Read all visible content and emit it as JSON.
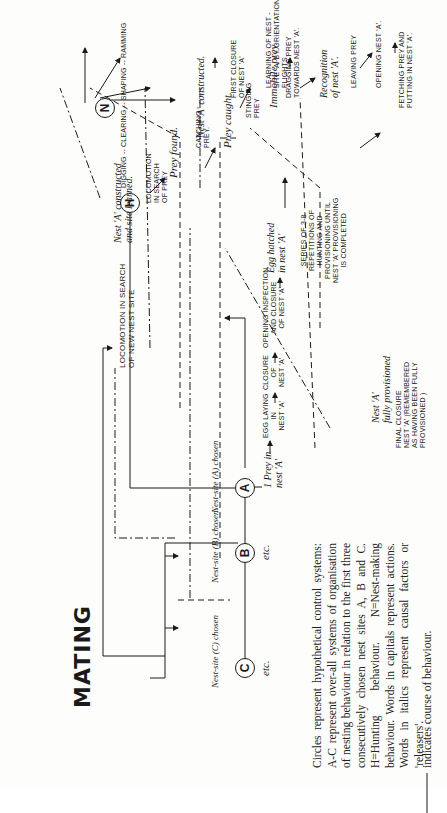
{
  "figure": {
    "title": "MATING",
    "control_systems": [
      {
        "id": "A",
        "label": "Nest-site (A) chosen"
      },
      {
        "id": "B",
        "label": "Nest-site (B) chosen."
      },
      {
        "id": "C",
        "label": "Nest-site (C) chosen"
      },
      {
        "id": "H",
        "label": ""
      },
      {
        "id": "N",
        "label": ""
      }
    ],
    "etc_label": "etc.",
    "nodes": {
      "locomotion_nest_site_1": "Locomotion in search",
      "locomotion_nest_site_2": "of new nest site",
      "prey_in_nest_1": "1 Prey in",
      "prey_in_nest_2": "nest 'A'",
      "egg_laying_1": "Egg laying",
      "egg_laying_2": "in",
      "egg_laying_3": "nest 'A'",
      "closure_1": "Closure",
      "closure_2": "of",
      "closure_3": "nest 'A'",
      "opening_inspection_1": "Opening inspection",
      "opening_inspection_2": "and closure",
      "opening_inspection_3": "of nest 'A'",
      "egg_hatched_1": "Egg hatched",
      "egg_hatched_2": "in nest 'A'",
      "series_1": "Series of 3-8",
      "series_2": "repetitions of",
      "series_3": "hunting and",
      "series_4": "provisioning until",
      "series_5": "nest 'A' provisioning",
      "series_6": "is completed",
      "fully_provisioned_1": "Nest 'A'",
      "fully_provisioned_2": "fully provisioned",
      "final_closure_1": "Final closure",
      "final_closure_2": "nest 'A' (remembered",
      "final_closure_3": "as having been fully",
      "final_closure_4": "provisioned )",
      "nest_constructed_learned_1": "Nest 'A' constructed",
      "nest_constructed_learned_2": "and site learned.",
      "locomotion_prey_1": "Locomotion",
      "locomotion_prey_2": "in search",
      "locomotion_prey_3": "of prey",
      "prey_found": "Prey found.",
      "catching_prey_1": "Catching",
      "catching_prey_2": "prey.",
      "prey_caught": "Prey caught.",
      "stinging_prey_1": "Stinging",
      "stinging_prey_2": "prey",
      "immobile_prey": "Immobile prey.",
      "dragging_prey_1": "Dragging prey",
      "dragging_prey_2": "towards nest 'A'.",
      "recognition_1": "Recognition",
      "recognition_2": "of nest 'A'.",
      "leaving_prey": "Leaving prey",
      "opening_nest": "Opening nest 'A'.",
      "fetching_prey_1": "Fetching prey and",
      "fetching_prey_2": "putting in nest 'A'.",
      "digging_row": "Digging -- Clearing -- Shaping -- Ramming",
      "nest_constructed": "Nest 'A' constructed.",
      "first_closure_1": "First closure",
      "first_closure_2": "of nest 'A'",
      "learning_1": "Learning of nest -",
      "learning_2": "site 'A' by orientation",
      "learning_3": "flights."
    },
    "caption": "Circles represent hypothetical control systems: A-C represent over-all systems of organisation of nesting behaviour in relation to the first three consecutively chosen nest sites A, B and C. H=Hunting behaviour. N=Nest-making behaviour. Words in capitals represent actions. Words in italics represent causal factors or 'releasers'.",
    "legend": [
      {
        "line": "solid",
        "text": "indicates course of behaviour."
      },
      {
        "line": "dash-dot",
        "text": "indicates course of behaviour where action appears to contribute to ensuing releaser."
      },
      {
        "line": "dashed",
        "text": "inhibitory effect (temporary)."
      },
      {
        "line": "long-dash + dash-dot (bracketed)",
        "text": "cyclic or repeated behaviour completing provisioning of nest A."
      },
      {
        "line": "dash-dot-dot",
        "text": "final inhibition of all behaviour relating to nest A."
      }
    ]
  }
}
